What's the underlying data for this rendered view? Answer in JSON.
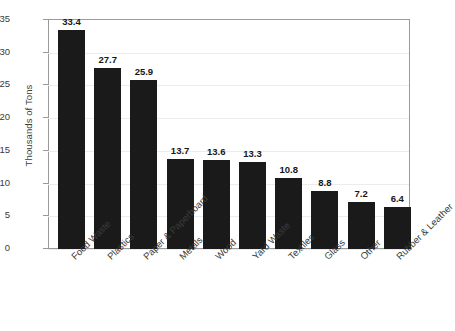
{
  "chart_data": {
    "type": "bar",
    "title": "",
    "subtitle": "",
    "xlabel": "",
    "ylabel": "Thousands of Tons",
    "ylim": [
      0,
      35
    ],
    "y_ticks": [
      0,
      5,
      10,
      15,
      20,
      25,
      30,
      35
    ],
    "grid": "horizontal",
    "legend": "none",
    "bar_color": "#1a1a1a",
    "categories": [
      "Food Waste",
      "Plastics",
      "Paper & Paperboard",
      "Metals",
      "Wood",
      "Yard Waste",
      "Textiles",
      "Glass",
      "Other",
      "Rubber & Leather"
    ],
    "values": [
      33.4,
      27.7,
      25.9,
      13.7,
      13.6,
      13.3,
      10.8,
      8.8,
      7.2,
      6.4
    ],
    "value_labels": [
      "33.4",
      "27.7",
      "25.9",
      "13.7",
      "13.6",
      "13.3",
      "10.8",
      "8.8",
      "7.2",
      "6.4"
    ]
  },
  "axis": {
    "y_tick_labels": [
      "0",
      "5",
      "10",
      "15",
      "20",
      "25",
      "30",
      "35"
    ],
    "y_title": "Thousands of Tons"
  },
  "colors": {
    "bar": "#1a1a1a",
    "axis": "#9a9a9a",
    "grid": "#ececec",
    "text": "#3a3a3a",
    "value_text": "#171717",
    "background": "#ffffff"
  }
}
